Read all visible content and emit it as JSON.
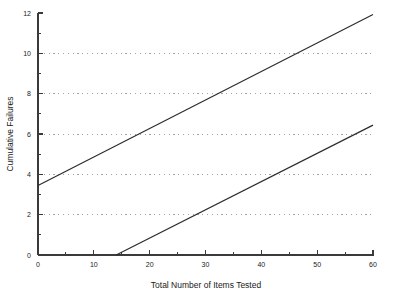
{
  "chart_data": {
    "type": "line",
    "title": "",
    "xlabel": "Total Number of Items Tested",
    "ylabel": "Cumulative Failures",
    "xlim": [
      0,
      60
    ],
    "ylim": [
      0,
      12
    ],
    "grid": true,
    "grid_axis": "y",
    "legend": "none",
    "x_ticks": [
      0,
      10,
      20,
      30,
      40,
      50,
      60
    ],
    "x_tick_labels": [
      "0",
      "10",
      "20",
      "30",
      "40",
      "50",
      "60"
    ],
    "x_minor_ticks": [
      5,
      15,
      25,
      35,
      45,
      55
    ],
    "y_ticks": [
      0,
      2,
      4,
      6,
      8,
      10,
      12
    ],
    "y_tick_labels": [
      "0",
      "2",
      "4",
      "6",
      "8",
      "10",
      "12"
    ],
    "y_minor_ticks": [
      1,
      3,
      5,
      7,
      9,
      11
    ],
    "y_gridlines": [
      2,
      4,
      6,
      8,
      10
    ],
    "series": [
      {
        "name": "upper-bound-line",
        "color": "#2b2b2b",
        "points": [
          [
            0,
            3.45
          ],
          [
            60,
            11.93
          ]
        ]
      },
      {
        "name": "lower-bound-line",
        "color": "#2b2b2b",
        "points": [
          [
            14,
            0
          ],
          [
            60,
            6.44
          ]
        ]
      }
    ]
  },
  "axes": {
    "x_title": "Total Number of Items Tested",
    "y_title": "Cumulative Failures"
  },
  "colors": {
    "background": "#ffffff",
    "axis": "#3a3a3a",
    "grid": "#9a9a9a",
    "series": "#2b2b2b",
    "text": "#1a1a1a"
  }
}
